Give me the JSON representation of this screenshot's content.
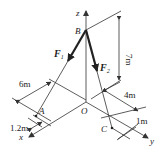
{
  "diagram": {
    "type": "3d-force-system",
    "points": {
      "origin": "O",
      "top": "B",
      "anchor_a": "A",
      "anchor_c": "C"
    },
    "axes": {
      "x": "x",
      "y": "y",
      "z": "z"
    },
    "forces": [
      {
        "name": "F",
        "subscript": "1",
        "from": "B",
        "toward": "A"
      },
      {
        "name": "F",
        "subscript": "2",
        "from": "B",
        "toward": "C"
      }
    ],
    "dimensions": {
      "height": "7m",
      "a_offset_y": "6m",
      "a_offset_x": "1.2m",
      "c_offset_x": "4m",
      "c_offset_y": "1m"
    },
    "colors": {
      "line": "#333333",
      "force": "#222222"
    }
  }
}
